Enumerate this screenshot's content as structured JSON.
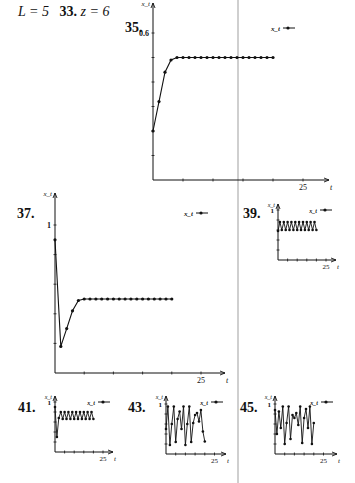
{
  "header": {
    "prefix_eq": "L = 5",
    "item33_label": "33.",
    "item33_eq": "z = 6",
    "item35_label": "35."
  },
  "colors": {
    "line": "#111111",
    "divider": "#cfcfcf",
    "background": "#ffffff"
  },
  "chart_data": [
    {
      "id": "35",
      "label": "35.",
      "type": "line",
      "title": "",
      "xlabel": "t",
      "ylabel": "x_t",
      "legend": [
        "x_t"
      ],
      "legend_position": "top-right",
      "x_tick_labels": [
        "25"
      ],
      "y_tick_labels": [
        "0.6"
      ],
      "xlim": [
        0,
        29
      ],
      "ylim": [
        0,
        0.7
      ],
      "grid": false,
      "x": [
        0,
        1,
        2,
        3,
        4,
        5,
        6,
        7,
        8,
        9,
        10,
        11,
        12,
        13,
        14,
        15,
        16,
        17,
        18,
        19,
        20
      ],
      "values": [
        0.2,
        0.32,
        0.44,
        0.49,
        0.5,
        0.5,
        0.5,
        0.5,
        0.5,
        0.5,
        0.5,
        0.5,
        0.5,
        0.5,
        0.5,
        0.5,
        0.5,
        0.5,
        0.5,
        0.5,
        0.5
      ]
    },
    {
      "id": "37",
      "label": "37.",
      "type": "line",
      "title": "",
      "xlabel": "t",
      "ylabel": "x_t",
      "legend": [
        "x_t"
      ],
      "legend_position": "top-right",
      "x_tick_labels": [
        "25"
      ],
      "y_tick_labels": [
        "1"
      ],
      "xlim": [
        0,
        29
      ],
      "ylim": [
        0,
        1.1
      ],
      "grid": false,
      "x": [
        0,
        1,
        2,
        3,
        4,
        5,
        6,
        7,
        8,
        9,
        10,
        11,
        12,
        13,
        14,
        15,
        16,
        17,
        18,
        19,
        20
      ],
      "values": [
        0.9,
        0.18,
        0.3,
        0.42,
        0.49,
        0.5,
        0.5,
        0.5,
        0.5,
        0.5,
        0.5,
        0.5,
        0.5,
        0.5,
        0.5,
        0.5,
        0.5,
        0.5,
        0.5,
        0.5,
        0.5
      ]
    },
    {
      "id": "39",
      "label": "39.",
      "type": "line",
      "title": "",
      "xlabel": "t",
      "ylabel": "x_t",
      "legend": [
        "x_t"
      ],
      "legend_position": "top-right",
      "x_tick_labels": [
        "25"
      ],
      "y_tick_labels": [
        "1"
      ],
      "xlim": [
        0,
        29
      ],
      "ylim": [
        0,
        1.1
      ],
      "grid": false,
      "x": [
        0,
        1,
        2,
        3,
        4,
        5,
        6,
        7,
        8,
        9,
        10,
        11,
        12,
        13,
        14,
        15,
        16,
        17,
        18,
        19,
        20
      ],
      "values": [
        0.58,
        0.76,
        0.6,
        0.76,
        0.6,
        0.76,
        0.6,
        0.76,
        0.6,
        0.76,
        0.6,
        0.76,
        0.6,
        0.76,
        0.6,
        0.76,
        0.6,
        0.76,
        0.6,
        0.76,
        0.6
      ]
    },
    {
      "id": "41",
      "label": "41.",
      "type": "line",
      "title": "",
      "xlabel": "t",
      "ylabel": "x_t",
      "legend": [
        "x_t"
      ],
      "legend_position": "top-right",
      "x_tick_labels": [
        "25"
      ],
      "y_tick_labels": [
        "1"
      ],
      "xlim": [
        0,
        29
      ],
      "ylim": [
        0,
        1.1
      ],
      "grid": false,
      "x": [
        0,
        1,
        2,
        3,
        4,
        5,
        6,
        7,
        8,
        9,
        10,
        11,
        12,
        13,
        14,
        15,
        16,
        17,
        18,
        19,
        20
      ],
      "values": [
        0.9,
        0.3,
        0.68,
        0.8,
        0.66,
        0.8,
        0.66,
        0.8,
        0.66,
        0.8,
        0.66,
        0.8,
        0.66,
        0.8,
        0.66,
        0.8,
        0.66,
        0.8,
        0.66,
        0.8,
        0.66
      ]
    },
    {
      "id": "43",
      "label": "43.",
      "type": "line",
      "title": "",
      "xlabel": "t",
      "ylabel": "x_t",
      "legend": [
        "x_t"
      ],
      "legend_position": "top-right",
      "x_tick_labels": [
        "25"
      ],
      "y_tick_labels": [
        "1"
      ],
      "xlim": [
        0,
        29
      ],
      "ylim": [
        0,
        1.1
      ],
      "grid": false,
      "x": [
        0,
        1,
        2,
        3,
        4,
        5,
        6,
        7,
        8,
        9,
        10,
        11,
        12,
        13,
        14,
        15,
        16,
        17,
        18,
        19,
        20
      ],
      "values": [
        0.5,
        0.95,
        0.18,
        0.6,
        0.95,
        0.24,
        0.7,
        0.85,
        0.5,
        0.95,
        0.18,
        0.6,
        0.95,
        0.24,
        0.62,
        0.78,
        0.82,
        0.65,
        0.88,
        0.45,
        0.25
      ]
    },
    {
      "id": "45",
      "label": "45.",
      "type": "line",
      "title": "",
      "xlabel": "t",
      "ylabel": "x_t",
      "legend": [
        "x_t"
      ],
      "legend_position": "top-right",
      "x_tick_labels": [
        "25"
      ],
      "y_tick_labels": [
        "1"
      ],
      "xlim": [
        0,
        29
      ],
      "ylim": [
        0,
        1.1
      ],
      "grid": false,
      "x": [
        0,
        1,
        2,
        3,
        4,
        5,
        6,
        7,
        8,
        9,
        10,
        11,
        12,
        13,
        14,
        15,
        16,
        17,
        18,
        19,
        20
      ],
      "values": [
        0.88,
        0.4,
        0.85,
        0.52,
        0.95,
        0.2,
        0.62,
        0.95,
        0.3,
        0.78,
        0.72,
        0.82,
        0.58,
        0.95,
        0.22,
        0.72,
        0.9,
        0.52,
        0.95,
        0.2,
        0.62
      ]
    }
  ],
  "layout": [
    {
      "plot": {
        "x0": 153,
        "y0": 180,
        "w": 176,
        "h": 177
      },
      "label_pos": [
        125,
        20
      ],
      "px_per_t": 6.0,
      "y_tick_step": 0.1,
      "y_ticks": 6,
      "y_label_val": 0.6,
      "px_per_y": 245,
      "legend_pos": [
        280,
        28
      ],
      "n_x_ticks": 5
    },
    {
      "plot": {
        "x0": 55,
        "y0": 373,
        "w": 170,
        "h": 180
      },
      "label_pos": [
        17,
        206
      ],
      "px_per_t": 5.84,
      "y_tick_step": 0.2,
      "y_ticks": 5,
      "y_label_val": 1,
      "px_per_y": 148,
      "legend_pos": [
        193,
        213
      ],
      "n_x_ticks": 5
    },
    {
      "plot": {
        "x0": 278,
        "y0": 260,
        "w": 58,
        "h": 56
      },
      "label_pos": [
        243,
        206
      ],
      "px_per_t": 1.92,
      "y_tick_step": 0.2,
      "y_ticks": 5,
      "y_label_val": 1,
      "px_per_y": 50,
      "legend_pos": [
        317,
        210
      ],
      "n_x_ticks": 5
    },
    {
      "plot": {
        "x0": 55,
        "y0": 452,
        "w": 58,
        "h": 56
      },
      "label_pos": [
        18,
        400
      ],
      "px_per_t": 1.92,
      "y_tick_step": 0.2,
      "y_ticks": 5,
      "y_label_val": 1,
      "px_per_y": 50,
      "legend_pos": [
        95,
        402
      ],
      "n_x_ticks": 5
    },
    {
      "plot": {
        "x0": 166,
        "y0": 454,
        "w": 60,
        "h": 58
      },
      "label_pos": [
        128,
        400
      ],
      "px_per_t": 1.94,
      "y_tick_step": 0.2,
      "y_ticks": 5,
      "y_label_val": 1,
      "px_per_y": 50,
      "legend_pos": [
        208,
        402
      ],
      "n_x_ticks": 5
    },
    {
      "plot": {
        "x0": 275,
        "y0": 454,
        "w": 62,
        "h": 58
      },
      "label_pos": [
        240,
        400
      ],
      "px_per_t": 1.94,
      "y_tick_step": 0.2,
      "y_ticks": 5,
      "y_label_val": 1,
      "px_per_y": 50,
      "legend_pos": [
        318,
        402
      ],
      "n_x_ticks": 5
    }
  ]
}
